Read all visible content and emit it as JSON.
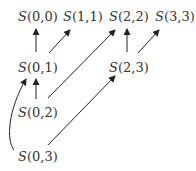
{
  "diagram": {
    "type": "directed-graph",
    "nodes": [
      {
        "id": "S00",
        "letter": "S",
        "args": "(0,0)",
        "x": 18,
        "y": 10
      },
      {
        "id": "S11",
        "letter": "S",
        "args": "(1,1)",
        "x": 63,
        "y": 10
      },
      {
        "id": "S22",
        "letter": "S",
        "args": "(2,2)",
        "x": 109,
        "y": 10
      },
      {
        "id": "S33",
        "letter": "S",
        "args": "(3,3)",
        "x": 155,
        "y": 10
      },
      {
        "id": "S01",
        "letter": "S",
        "args": "(0,1)",
        "x": 18,
        "y": 61
      },
      {
        "id": "S23",
        "letter": "S",
        "args": "(2,3)",
        "x": 109,
        "y": 61
      },
      {
        "id": "S02",
        "letter": "S",
        "args": "(0,2)",
        "x": 18,
        "y": 106
      },
      {
        "id": "S03",
        "letter": "S",
        "args": "(0,3)",
        "x": 18,
        "y": 150
      }
    ],
    "edges": [
      {
        "from": "S01",
        "to": "S00"
      },
      {
        "from": "S01",
        "to": "S11"
      },
      {
        "from": "S02",
        "to": "S01"
      },
      {
        "from": "S02",
        "to": "S22"
      },
      {
        "from": "S03",
        "to": "S01",
        "curved": true
      },
      {
        "from": "S03",
        "to": "S23"
      },
      {
        "from": "S23",
        "to": "S22"
      },
      {
        "from": "S23",
        "to": "S33"
      }
    ]
  }
}
